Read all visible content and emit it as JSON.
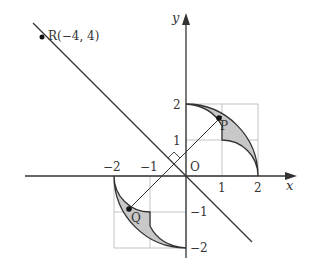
{
  "diagram": {
    "axes": {
      "x_label": "x",
      "y_label": "y",
      "origin_label": "O"
    },
    "ticks": {
      "x": [
        {
          "value": -2,
          "label": "−2"
        },
        {
          "value": -1,
          "label": "−1"
        },
        {
          "value": 1,
          "label": "1"
        },
        {
          "value": 2,
          "label": "2"
        }
      ],
      "y": [
        {
          "value": 2,
          "label": "2"
        },
        {
          "value": 1,
          "label": "1"
        },
        {
          "value": -1,
          "label": "−1"
        },
        {
          "value": -2,
          "label": "−2"
        }
      ]
    },
    "points": {
      "R": {
        "label": "R(−4, 4)",
        "x": -4,
        "y": 4
      },
      "P": {
        "label": "P"
      },
      "Q": {
        "label": "Q"
      }
    },
    "lines": [
      "y = −x through R(−4, 4)",
      "line PQ perpendicular to y = −x"
    ],
    "shaded_regions": [
      "region near P in quadrant I",
      "region near Q in quadrant III"
    ],
    "colors": {
      "shade": "#c8c8c8",
      "stroke": "#333333",
      "grid": "#b0b0b0"
    }
  }
}
